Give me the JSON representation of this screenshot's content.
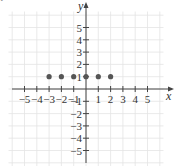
{
  "marker": "•",
  "chart_data": {
    "type": "scatter",
    "title": "",
    "xlabel": "x",
    "ylabel": "y",
    "xlim": [
      -6,
      6
    ],
    "ylim": [
      -6,
      6
    ],
    "grid": true,
    "x_ticks": [
      -5,
      -4,
      -3,
      -2,
      -1,
      1,
      2,
      3,
      4,
      5
    ],
    "y_ticks": [
      -5,
      -4,
      -3,
      -2,
      -1,
      1,
      2,
      3,
      4,
      5
    ],
    "points": [
      {
        "x": -3,
        "y": 1
      },
      {
        "x": -2,
        "y": 1
      },
      {
        "x": -1,
        "y": 1
      },
      {
        "x": 0,
        "y": 1
      },
      {
        "x": 1,
        "y": 1
      },
      {
        "x": 2,
        "y": 1
      }
    ],
    "point_color": "#555555"
  }
}
